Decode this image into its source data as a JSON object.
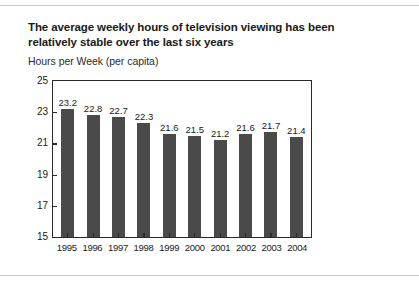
{
  "chart_data": {
    "type": "bar",
    "title": "The average weekly hours of television viewing has been relatively stable over the last six years",
    "subtitle": "Hours per Week (per capita)",
    "xlabel": "",
    "ylabel": "Hours per Week (per capita)",
    "categories": [
      "1995",
      "1996",
      "1997",
      "1998",
      "1999",
      "2000",
      "2001",
      "2002",
      "2003",
      "2004"
    ],
    "values": [
      23.2,
      22.8,
      22.7,
      22.3,
      21.6,
      21.5,
      21.2,
      21.6,
      21.7,
      21.4
    ],
    "value_labels": [
      "23.2",
      "22.8",
      "22.7",
      "22.3",
      "21.6",
      "21.5",
      "21.2",
      "21.6",
      "21.7",
      "21.4"
    ],
    "ylim": [
      15,
      25
    ],
    "yticks": [
      25,
      23,
      21,
      19,
      17,
      15
    ],
    "ytick_labels": [
      "25",
      "23",
      "21",
      "19",
      "17",
      "15"
    ],
    "grid": false,
    "legend": "none",
    "bar_color": "#4a4a4a",
    "axis_color": "#2a2a2a",
    "background": "#ffffff"
  },
  "page": {
    "title_line_1": "The average weekly hours of television viewing has",
    "title_line_2": "been relatively stable over the last six years",
    "rule_color": "#c8c8c8"
  }
}
